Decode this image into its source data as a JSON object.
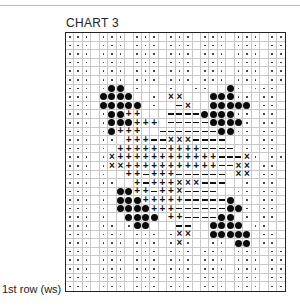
{
  "title": "CHART 3",
  "row_label": "1st row (ws)",
  "legend_symbols": {
    ".": "dot",
    " ": "blank",
    "o": "filled-circle",
    "+": "plus",
    "-": "dash",
    "x": "cross"
  },
  "grid": {
    "columns": 26,
    "rows": 30,
    "cells": [
      "... ... ... ... ... ... ..",
      "... ... ... ... ... ... ..",
      "... ... ... ... ... ... ..",
      "... ... ... ... ... ... ..",
      "... ... ... ... ... ... ..",
      "... ... ... ... ... ... ..",
      "... .oo .   .  ..  o. ...",
      "... oooo  . xx   ooo.. ..",
      "... ooooo .  -x  ooooo ..",
      "... .oo++   ----oooo.. ..",
      "... .ooo+++ -----oooo. ..",
      "... .o+++  -------oo.. ..",
      "... .. +++--xxx----  . ..",
      "... . +++++-++++---- . ..",
      "... .x++++++++++++---x. ..",
      "... .xx+++++++++++--xx ..",
      "... .  ++-+++------ xx ..",
      "... ..  +-+++xxx---  . ..",
      "... . oo++-++x----  .. ..",
      "... . ooo+++++-----o . ..",
      "... . oooo+++------oo. ..",
      "... .  oooo ++----oo . ..",
      "... .. .oo   --  oooo ..",
      "... ... ... .xx  ooooo ..",
      "... ... ... .x.  .. oo ..",
      "... ... ... ... ... ... ..",
      "... ... ... ... ... ... ..",
      "... ... ... ... ... ... ..",
      "... ... ... ... ... ... ..",
      "... ... ... ... ... ... .."
    ]
  }
}
